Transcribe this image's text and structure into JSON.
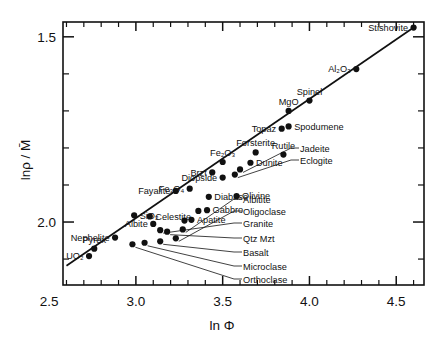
{
  "chart_data": {
    "type": "scatter",
    "title": "",
    "xlabel": "ln Φ",
    "ylabel": "lnρ / M̄",
    "xlim": [
      2.58,
      4.66
    ],
    "ylim_display_top": 1.46,
    "ylim_display_bottom": 2.17,
    "y_axis_inverted": true,
    "grid": false,
    "legend": "none",
    "x_ticks_labeled": [
      "2.5",
      "3.0",
      "3.5",
      "4.0",
      "4.5"
    ],
    "x_ticks_labeled_values": [
      2.5,
      3.0,
      3.5,
      4.0,
      4.5
    ],
    "x_tick_step_minor": 0.1,
    "y_ticks_labeled": [
      "1.5",
      "2.0"
    ],
    "y_ticks_labeled_values": [
      1.5,
      2.0
    ],
    "y_tick_step_minor": 0.1,
    "trendline": {
      "x1": 2.6,
      "y1": 2.118,
      "x2": 4.6,
      "y2": 1.475
    },
    "points": [
      {
        "label": "Stishovite",
        "x": 4.6,
        "y": 1.475,
        "label_pos": "left"
      },
      {
        "label": "Al₂O₃",
        "x": 4.27,
        "y": 1.587,
        "label_pos": "left"
      },
      {
        "label": "Spinel",
        "x": 4.0,
        "y": 1.672,
        "label_pos": "above"
      },
      {
        "label": "MgO",
        "x": 3.88,
        "y": 1.7,
        "label_pos": "above"
      },
      {
        "label": "Spodumene",
        "x": 3.88,
        "y": 1.742,
        "label_pos": "right"
      },
      {
        "label": "Topaz",
        "x": 3.84,
        "y": 1.748,
        "label_pos": "left"
      },
      {
        "label": "Rutile",
        "x": 3.85,
        "y": 1.818,
        "label_pos": "above"
      },
      {
        "label": "Forsterite",
        "x": 3.69,
        "y": 1.812,
        "label_pos": "above"
      },
      {
        "label": "Dunite",
        "x": 3.66,
        "y": 1.84,
        "label_pos": "right"
      },
      {
        "label": "Jadeite",
        "x": 3.6,
        "y": 1.858,
        "label_pos": "leader"
      },
      {
        "label": "Eclogite",
        "x": 3.57,
        "y": 1.872,
        "label_pos": "leader"
      },
      {
        "label": "Fe₂O₃",
        "x": 3.5,
        "y": 1.838,
        "label_pos": "above"
      },
      {
        "label": "Brzt",
        "x": 3.44,
        "y": 1.866,
        "label_pos": "left"
      },
      {
        "label": "Diopside",
        "x": 3.5,
        "y": 1.88,
        "label_pos": "left"
      },
      {
        "label": "Olivine",
        "x": 3.58,
        "y": 1.93,
        "label_pos": "right"
      },
      {
        "label": "Diabase",
        "x": 3.42,
        "y": 1.932,
        "label_pos": "right"
      },
      {
        "label": "Fe₃O₄",
        "x": 3.31,
        "y": 1.91,
        "label_pos": "left"
      },
      {
        "label": "Fayalite",
        "x": 3.23,
        "y": 1.916,
        "label_pos": "left"
      },
      {
        "label": "Gabbro",
        "x": 3.41,
        "y": 1.968,
        "label_pos": "right"
      },
      {
        "label": "Gabbro2",
        "x": 3.36,
        "y": 1.97,
        "label_pos": "none"
      },
      {
        "label": "Apatite",
        "x": 3.32,
        "y": 1.994,
        "label_pos": "right"
      },
      {
        "label": "Apatite2",
        "x": 3.28,
        "y": 1.996,
        "label_pos": "none"
      },
      {
        "label": "Albitite",
        "x": 3.27,
        "y": 2.02,
        "label_pos": "leader"
      },
      {
        "label": "Oligoclase",
        "x": 3.23,
        "y": 2.044,
        "label_pos": "leader"
      },
      {
        "label": "Celestite",
        "x": 3.08,
        "y": 1.985,
        "label_pos": "right"
      },
      {
        "label": "SiO₂",
        "x": 2.99,
        "y": 1.982,
        "label_pos": "right"
      },
      {
        "label": "Albite",
        "x": 3.1,
        "y": 2.005,
        "label_pos": "left"
      },
      {
        "label": "Granite",
        "x": 3.14,
        "y": 2.022,
        "label_pos": "leader"
      },
      {
        "label": "Qtz Mzt",
        "x": 3.18,
        "y": 2.026,
        "label_pos": "leader"
      },
      {
        "label": "Basalt",
        "x": 3.14,
        "y": 2.052,
        "label_pos": "leader"
      },
      {
        "label": "Microclase",
        "x": 3.05,
        "y": 2.056,
        "label_pos": "leader"
      },
      {
        "label": "Orthoclase",
        "x": 2.98,
        "y": 2.06,
        "label_pos": "leader"
      },
      {
        "label": "Nephelite",
        "x": 2.88,
        "y": 2.042,
        "label_pos": "left"
      },
      {
        "label": "Pyrex",
        "x": 2.76,
        "y": 2.072,
        "label_pos": "above"
      },
      {
        "label": "UO₂",
        "x": 2.73,
        "y": 2.092,
        "label_pos": "left"
      }
    ]
  }
}
